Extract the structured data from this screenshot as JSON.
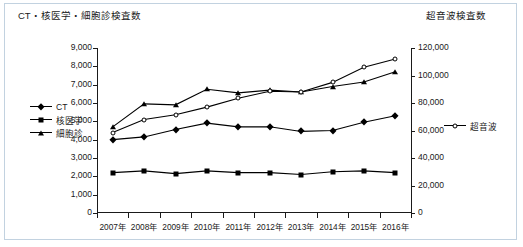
{
  "chart_data": {
    "type": "line",
    "title": "",
    "categories": [
      "2007年",
      "2008年",
      "2009年",
      "2010年",
      "2011年",
      "2012年",
      "2013年",
      "2014年",
      "2015年",
      "2016年"
    ],
    "x": [
      2007,
      2008,
      2009,
      2010,
      2011,
      2012,
      2013,
      2014,
      2015,
      2016
    ],
    "grid": false,
    "legend_position": "left-middle and right-middle",
    "left_axis": {
      "label": "CT・核医学・細胞診検査数",
      "ylim": [
        0,
        9000
      ],
      "ticks": [
        0,
        1000,
        2000,
        3000,
        4000,
        5000,
        6000,
        7000,
        8000,
        9000
      ],
      "tick_labels": [
        "0",
        "1,000",
        "2,000",
        "3,000",
        "4,000",
        "5,000",
        "6,000",
        "7,000",
        "8,000",
        "9,000"
      ]
    },
    "right_axis": {
      "label": "超音波検査数",
      "ylim": [
        0,
        120000
      ],
      "ticks": [
        0,
        20000,
        40000,
        60000,
        80000,
        100000,
        120000
      ],
      "tick_labels": [
        "0",
        "20,000",
        "40,000",
        "60,000",
        "80,000",
        "100,000",
        "120,000"
      ]
    },
    "series": [
      {
        "name": "CT",
        "axis": "left",
        "marker": "diamond-filled",
        "color": "#000000",
        "values": [
          4000,
          4150,
          4550,
          4900,
          4700,
          4700,
          4450,
          4500,
          4950,
          5300
        ]
      },
      {
        "name": "核医学",
        "axis": "left",
        "marker": "square-filled",
        "color": "#000000",
        "values": [
          2200,
          2300,
          2150,
          2300,
          2200,
          2200,
          2100,
          2250,
          2300,
          2200
        ]
      },
      {
        "name": "細胞診",
        "axis": "left",
        "marker": "triangle-filled",
        "color": "#000000",
        "values": [
          4700,
          5950,
          5900,
          6750,
          6550,
          6700,
          6600,
          6900,
          7150,
          7700
        ]
      },
      {
        "name": "超音波",
        "axis": "right",
        "marker": "circle-open",
        "color": "#000000",
        "values": [
          58500,
          68000,
          71500,
          77000,
          83500,
          88500,
          88000,
          95000,
          106000,
          112000
        ]
      }
    ]
  },
  "legend_left": {
    "items": [
      {
        "label": "CT",
        "marker": "diamond-filled"
      },
      {
        "label": "核医学",
        "marker": "square-filled"
      },
      {
        "label": "細胞診",
        "marker": "triangle-filled"
      }
    ]
  },
  "legend_right": {
    "items": [
      {
        "label": "超音波",
        "marker": "circle-open"
      }
    ]
  }
}
